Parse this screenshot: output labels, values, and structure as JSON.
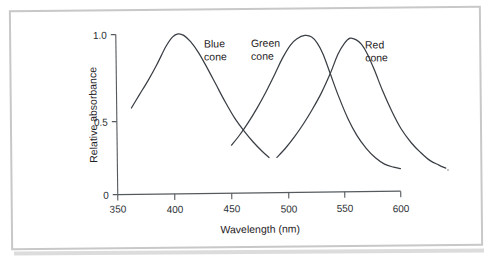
{
  "figure": {
    "caption_present": false
  },
  "chart_data": {
    "type": "line",
    "title": "",
    "subtitle": "",
    "xlabel": "Wavelength (nm)",
    "ylabel": "Relative absorbance",
    "xlim": [
      350,
      600
    ],
    "ylim": [
      0,
      1.0
    ],
    "xticks": [
      350,
      400,
      450,
      500,
      550,
      600
    ],
    "xtick_labels": [
      "350",
      "400",
      "450",
      "500",
      "550",
      "600"
    ],
    "yticks": [
      0,
      0.5,
      1.0
    ],
    "ytick_labels": [
      "0",
      "0.5",
      "1.0"
    ],
    "grid": false,
    "legend_position": "inline-annotations",
    "annotations": [
      {
        "name": "blue-cone-label",
        "lines": [
          "Blue",
          "cone"
        ],
        "x": 428,
        "y": 0.93
      },
      {
        "name": "green-cone-label",
        "lines": [
          "Green",
          "cone"
        ],
        "x": 475,
        "y": 0.93
      },
      {
        "name": "red-cone-label",
        "lines": [
          "Red",
          "cone"
        ],
        "x": 567,
        "y": 0.9
      }
    ],
    "series": [
      {
        "name": "Blue cone",
        "peak_wavelength": 405,
        "peak_value": 1.0,
        "x": [
          363,
          370,
          378,
          386,
          394,
          400,
          405,
          410,
          416,
          423,
          430,
          438,
          446,
          454,
          462,
          470,
          478,
          484
        ],
        "values": [
          0.54,
          0.62,
          0.71,
          0.81,
          0.92,
          0.98,
          1.0,
          0.99,
          0.95,
          0.88,
          0.79,
          0.68,
          0.57,
          0.47,
          0.39,
          0.32,
          0.26,
          0.22
        ]
      },
      {
        "name": "Green cone",
        "peak_wavelength": 517,
        "peak_value": 0.98,
        "x": [
          451,
          458,
          466,
          474,
          482,
          490,
          497,
          504,
          510,
          517,
          523,
          528,
          533,
          539,
          546,
          554,
          562,
          570,
          578,
          586,
          594,
          600
        ],
        "values": [
          0.3,
          0.36,
          0.44,
          0.53,
          0.63,
          0.74,
          0.84,
          0.92,
          0.96,
          0.98,
          0.97,
          0.93,
          0.86,
          0.74,
          0.6,
          0.46,
          0.35,
          0.27,
          0.21,
          0.17,
          0.15,
          0.14
        ]
      },
      {
        "name": "Red cone",
        "peak_wavelength": 556,
        "peak_value": 0.96,
        "x": [
          491,
          499,
          507,
          515,
          523,
          531,
          539,
          546,
          552,
          557,
          562,
          567,
          572,
          578,
          585,
          593,
          601,
          610,
          618,
          626,
          634,
          640
        ],
        "values": [
          0.22,
          0.28,
          0.35,
          0.43,
          0.52,
          0.62,
          0.74,
          0.86,
          0.93,
          0.96,
          0.95,
          0.92,
          0.86,
          0.76,
          0.63,
          0.5,
          0.39,
          0.3,
          0.24,
          0.19,
          0.16,
          0.14
        ]
      }
    ]
  }
}
